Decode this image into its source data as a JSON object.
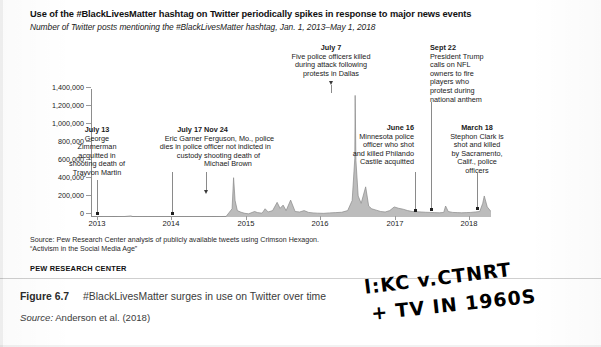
{
  "figure": {
    "title": "Use of the #BlackLivesMatter hashtag on Twitter periodically spikes in response to major news events",
    "subtitle": "Number of Twitter posts mentioning the #BlackLivesMatter hashtag, Jan. 1, 2013–May 1, 2018",
    "source_line1": "Source: Pew Research Center analysis of publicly available tweets using Crimson Hexagon.",
    "source_line2": "“Activism in the Social Media Age”",
    "org": "PEW RESEARCH CENTER"
  },
  "caption": {
    "figure_number": "Figure 6.7",
    "text": "#BlackLivesMatter surges in use on Twitter over time",
    "credit_label": "Source:",
    "credit_text": "Anderson et al. (2018)"
  },
  "handwriting": {
    "line1": "l:KC v.CTNRT",
    "line2": "+ TV IN 1960S"
  },
  "chart_data": {
    "type": "line",
    "title": "Use of the #BlackLivesMatter hashtag on Twitter periodically spikes in response to major news events",
    "subtitle": "Number of Twitter posts mentioning the #BlackLivesMatter hashtag, Jan. 1, 2013–May 1, 2018",
    "xlabel": "",
    "ylabel": "",
    "grid": false,
    "legend": "none",
    "xlim": [
      "2013-01-01",
      "2018-05-01"
    ],
    "ylim": [
      0,
      1400000
    ],
    "ytick_labels": [
      "1,400,000",
      "1,200,000",
      "1,000,000",
      "800,000",
      "600,000",
      "400,000",
      "200,000",
      "0"
    ],
    "ytick_values": [
      1400000,
      1200000,
      1000000,
      800000,
      600000,
      400000,
      200000,
      0
    ],
    "xtick_labels": [
      "2013",
      "2014",
      "2015",
      "2016",
      "2017",
      "2018"
    ],
    "xtick_values": [
      2013,
      2014,
      2015,
      2016,
      2017,
      2018
    ],
    "series": [
      {
        "name": "Tweets mentioning #BlackLivesMatter",
        "x": [
          2013.0,
          2013.1,
          2013.2,
          2013.3,
          2013.4,
          2013.53,
          2013.56,
          2013.62,
          2013.7,
          2013.8,
          2013.9,
          2014.0,
          2014.1,
          2014.2,
          2014.3,
          2014.4,
          2014.54,
          2014.58,
          2014.65,
          2014.72,
          2014.8,
          2014.88,
          2014.9,
          2014.92,
          2014.95,
          2015.0,
          2015.05,
          2015.1,
          2015.18,
          2015.22,
          2015.28,
          2015.32,
          2015.36,
          2015.42,
          2015.48,
          2015.52,
          2015.56,
          2015.6,
          2015.66,
          2015.72,
          2015.78,
          2015.84,
          2015.9,
          2015.96,
          2016.02,
          2016.1,
          2016.18,
          2016.26,
          2016.34,
          2016.42,
          2016.48,
          2016.515,
          2016.52,
          2016.53,
          2016.56,
          2016.6,
          2016.66,
          2016.7,
          2016.74,
          2016.8,
          2016.86,
          2016.92,
          2016.98,
          2017.04,
          2017.1,
          2017.16,
          2017.22,
          2017.28,
          2017.34,
          2017.4,
          2017.46,
          2017.52,
          2017.58,
          2017.64,
          2017.7,
          2017.725,
          2017.76,
          2017.82,
          2017.88,
          2017.94,
          2018.0,
          2018.06,
          2018.12,
          2018.18,
          2018.22,
          2018.24,
          2018.28,
          2018.33
        ],
        "y": [
          1000,
          1200,
          1500,
          1300,
          1400,
          12000,
          4000,
          2500,
          2000,
          2200,
          2500,
          2600,
          3000,
          3500,
          3000,
          3200,
          3500,
          3800,
          4000,
          5000,
          6000,
          90000,
          430000,
          180000,
          70000,
          52000,
          40000,
          35000,
          60000,
          48000,
          42000,
          90000,
          55000,
          70000,
          160000,
          95000,
          130000,
          70000,
          185000,
          60000,
          55000,
          70000,
          50000,
          45000,
          42000,
          40000,
          45000,
          48000,
          52000,
          70000,
          180000,
          640000,
          1330000,
          620000,
          230000,
          150000,
          330000,
          120000,
          90000,
          75000,
          60000,
          55000,
          70000,
          110000,
          95000,
          85000,
          70000,
          60000,
          58000,
          55000,
          52000,
          50000,
          48000,
          46000,
          50000,
          120000,
          60000,
          50000,
          48000,
          46000,
          48000,
          50000,
          55000,
          60000,
          150000,
          230000,
          110000,
          60000
        ]
      }
    ],
    "annotations": [
      {
        "id": "july-13-2013",
        "date_label": "July 13",
        "text": "George Zimmerman acquitted in shooting death of Trayvon Martin",
        "lines": [
          "George",
          "Zimmerman",
          "acquitted in",
          "shooting death of",
          "Trayvon Martin"
        ],
        "x": 2013.53,
        "y": 12000
      },
      {
        "id": "july-17-2014",
        "date_label": "July 17",
        "text": "Eric Garner dies in police custody",
        "lines": [
          "Eric Garner",
          "dies in police",
          "custody"
        ],
        "x": 2014.54,
        "y": 3500
      },
      {
        "id": "nov-24-2014",
        "date_label": "Nov 24",
        "text": "Ferguson, Mo., police officer not indicted in shooting death of Michael Brown",
        "lines": [
          "Ferguson, Mo., police",
          "officer not indicted in",
          "shooting death of",
          "Michael Brown"
        ],
        "x": 2014.9,
        "y": 430000
      },
      {
        "id": "july-7-2016",
        "date_label": "July 7",
        "text": "Five police officers killed during attack following protests in Dallas",
        "lines": [
          "Five police officers killed",
          "during attack following",
          "protests in Dallas"
        ],
        "x": 2016.52,
        "y": 1330000
      },
      {
        "id": "june-16-2017",
        "date_label": "June 16",
        "text": "Minnesota police officer who shot and killed Philando Castile acquitted",
        "lines": [
          "Minnesota police",
          "officer who shot",
          "and killed Philando",
          "Castile acquitted"
        ],
        "x": 2017.46,
        "y": 52000
      },
      {
        "id": "sept-22-2017",
        "date_label": "Sept 22",
        "text": "President Trump calls on NFL owners to fire players who protest during national anthem",
        "lines": [
          "President Trump",
          "calls on NFL",
          "owners to fire",
          "players who",
          "protest during",
          "national anthem"
        ],
        "x": 2017.725,
        "y": 120000
      },
      {
        "id": "march-18-2018",
        "date_label": "March 18",
        "text": "Stephon Clark is shot and killed by Sacramento, Calif., police officers",
        "lines": [
          "Stephon Clark is",
          "shot and killed",
          "by Sacramento,",
          "Calif., police",
          "officers"
        ],
        "x": 2018.22,
        "y": 230000
      }
    ],
    "colors": {
      "line": "#8c8c8c",
      "fill": "#b9b9b9",
      "axis": "#8d8d8d",
      "text": "#1a1a1a"
    }
  }
}
